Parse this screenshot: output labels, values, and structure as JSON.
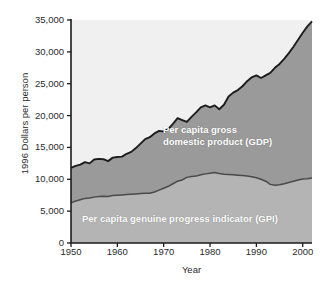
{
  "chart_data": {
    "type": "area",
    "title": "",
    "xlabel": "Year",
    "ylabel": "1996 Dollars per person",
    "xlim": [
      1950,
      2002
    ],
    "ylim": [
      0,
      35000
    ],
    "grid": false,
    "legend_position": "inside-plot-annotations",
    "stacked": true,
    "x_ticks": [
      1950,
      1960,
      1970,
      1980,
      1990,
      2000
    ],
    "x_tick_labels": [
      "1950",
      "1960",
      "1970",
      "1980",
      "1990",
      "2000"
    ],
    "y_ticks": [
      0,
      5000,
      10000,
      15000,
      20000,
      25000,
      30000,
      35000
    ],
    "y_tick_labels": [
      "0",
      "5,000",
      "10,000",
      "15,000",
      "20,000",
      "25,000",
      "30,000",
      "35,000"
    ],
    "colors": {
      "background_above": "#f0f0f0",
      "gdp_band": "#9a9a9a",
      "gpi_band": "#b4b4b4",
      "curve_line": "#1c1c1c",
      "axis": "#1c1c1c",
      "text": "#2b2b2b",
      "annotation_text": "#ffffff"
    },
    "x": [
      1950,
      1951,
      1952,
      1953,
      1954,
      1955,
      1956,
      1957,
      1958,
      1959,
      1960,
      1961,
      1962,
      1963,
      1964,
      1965,
      1966,
      1967,
      1968,
      1969,
      1970,
      1971,
      1972,
      1973,
      1974,
      1975,
      1976,
      1977,
      1978,
      1979,
      1980,
      1981,
      1982,
      1983,
      1984,
      1985,
      1986,
      1987,
      1988,
      1989,
      1990,
      1991,
      1992,
      1993,
      1994,
      1995,
      1996,
      1997,
      1998,
      1999,
      2000,
      2001,
      2002
    ],
    "series": [
      {
        "name": "Per capita genuine progress indicator (GPI)",
        "label": "Per capita genuine progress indicator (GPI)",
        "color": "#b4b4b4",
        "values": [
          6300,
          6600,
          6800,
          7000,
          7050,
          7200,
          7300,
          7350,
          7300,
          7450,
          7500,
          7550,
          7600,
          7650,
          7700,
          7750,
          7800,
          7820,
          8000,
          8300,
          8600,
          8900,
          9300,
          9700,
          9900,
          10300,
          10450,
          10500,
          10700,
          10850,
          10950,
          11050,
          10900,
          10800,
          10750,
          10700,
          10650,
          10600,
          10500,
          10400,
          10250,
          10000,
          9700,
          9200,
          9050,
          9150,
          9300,
          9500,
          9700,
          9900,
          10050,
          10100,
          10200
        ]
      },
      {
        "name": "Per capita gross domestic product (GDP)",
        "label": "Per capita gross\ndomestic product (GDP)",
        "color": "#9a9a9a",
        "values": [
          11800,
          12100,
          12300,
          12700,
          12500,
          13100,
          13200,
          13150,
          12850,
          13400,
          13500,
          13550,
          14000,
          14300,
          14900,
          15600,
          16300,
          16600,
          17200,
          17600,
          17500,
          17900,
          18700,
          19600,
          19300,
          19000,
          19800,
          20500,
          21300,
          21600,
          21300,
          21600,
          21000,
          21700,
          23000,
          23600,
          24000,
          24600,
          25400,
          26000,
          26300,
          25900,
          26300,
          26700,
          27500,
          28100,
          28900,
          29800,
          30800,
          31900,
          33000,
          34000,
          34800
        ]
      }
    ],
    "annotations": [
      {
        "name": "gdp-label",
        "text": "Per capita gross\ndomestic product (GDP)"
      },
      {
        "name": "gpi-label",
        "text": "Per capita genuine progress indicator (GPI)"
      }
    ]
  }
}
